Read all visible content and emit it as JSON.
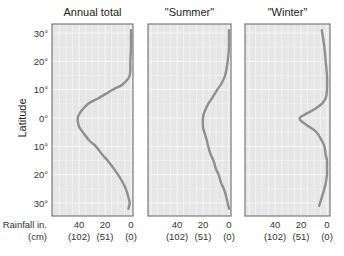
{
  "chart_data": {
    "type": "line",
    "layout": "three vertical panels sharing latitude axis; x-axis reversed (rainfall increases to the left)",
    "ylabel": "Latitude",
    "xlabel": "Rainfall in. (cm)",
    "xlabel_line1": "Rainfall in.",
    "xlabel_line2": "(cm)",
    "y_ticks": [
      "30°",
      "20°",
      "10°",
      "0°",
      "10°",
      "20°",
      "30°"
    ],
    "y_tick_values": [
      30,
      20,
      10,
      0,
      -10,
      -20,
      -30
    ],
    "ylim": [
      -33,
      33
    ],
    "x_ticks_in": [
      "40",
      "20",
      "0"
    ],
    "x_ticks_cm": [
      "(102)",
      "(51)",
      "(0)"
    ],
    "xlim": [
      60,
      0
    ],
    "grid": true,
    "line_color": "#8f8f8f",
    "panel_bg": "#e6e6e6",
    "panels": [
      {
        "title": "Annual total",
        "latitude": [
          31,
          25,
          20,
          15,
          12,
          10,
          7,
          5,
          2,
          0,
          -3,
          -5,
          -8,
          -10,
          -13,
          -15,
          -18,
          -20,
          -23,
          -25,
          -28,
          -30,
          -32
        ],
        "rainfall_in": [
          0,
          0,
          0.5,
          1,
          6,
          14,
          25,
          33,
          39,
          41,
          40,
          37,
          32,
          27,
          22,
          18,
          13,
          10,
          6,
          4,
          2,
          1,
          2
        ]
      },
      {
        "title": "\"Summer\"",
        "latitude": [
          31,
          25,
          20,
          15,
          12,
          10,
          7,
          5,
          2,
          0,
          -3,
          -5,
          -8,
          -10,
          -13,
          -15,
          -18,
          -20,
          -23,
          -25,
          -28,
          -30,
          -32
        ],
        "rainfall_in": [
          0,
          0,
          1,
          3,
          6,
          9,
          13,
          16,
          19,
          20,
          20,
          19,
          17,
          16,
          14,
          12,
          10,
          8,
          6,
          4,
          2,
          1,
          0
        ]
      },
      {
        "title": "\"Winter\"",
        "latitude": [
          31,
          25,
          20,
          15,
          10,
          7,
          5,
          3,
          1,
          0,
          -1,
          -3,
          -5,
          -8,
          -10,
          -13,
          -15,
          -18,
          -20,
          -23,
          -25,
          -28,
          -31
        ],
        "rainfall_in": [
          4,
          2,
          1,
          0,
          0,
          1,
          4,
          10,
          18,
          21,
          20,
          14,
          8,
          4,
          2,
          1,
          0,
          0,
          0,
          1,
          2,
          4,
          6
        ]
      }
    ]
  }
}
